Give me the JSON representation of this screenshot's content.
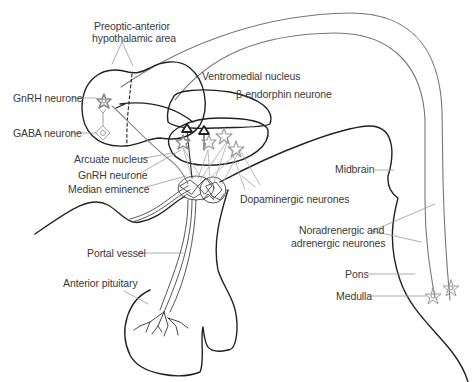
{
  "diagram": {
    "colors": {
      "outline": "#222222",
      "tract": "#777777",
      "neurone_grey": "#8a8a8a",
      "neurone_dark": "#333333",
      "leader": "#999999"
    },
    "labels": {
      "preoptic_line1": "Preoptic-anterior",
      "preoptic_line2": "hypothalamic area",
      "gnrh_neurone_top": "GnRH neurone",
      "gaba_neurone": "GABA neurone",
      "ventromedial_nucleus": "Ventromedial nucleus",
      "beta_endorphin_neurone": "β-endorphin neurone",
      "arcuate_nucleus": "Arcuate nucleus",
      "gnrh_neurone_arcuate": "GnRH neurone",
      "median_eminence": "Median eminence",
      "dopaminergic_neurones": "Dopaminergic neurones",
      "midbrain": "Midbrain",
      "noradrenergic_line1": "Noradrenergic and",
      "noradrenergic_line2": "adrenergic neurones",
      "portal_vessel": "Portal vessel",
      "anterior_pituitary": "Anterior pituitary",
      "pons": "Pons",
      "medulla": "Medulla"
    }
  }
}
